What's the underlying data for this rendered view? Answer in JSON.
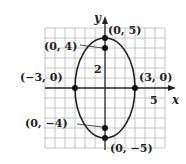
{
  "figure": {
    "axes": {
      "x_label": "x",
      "y_label": "y",
      "x_tick_label": "5",
      "y_tick_label": "2"
    },
    "ellipse": {
      "center": [
        0,
        0
      ],
      "semi_major_vertical": 5,
      "semi_minor_horizontal": 3
    },
    "points": [
      {
        "id": "top-vertex",
        "coords": [
          0,
          5
        ],
        "label": "(0, 5)"
      },
      {
        "id": "top-focus",
        "coords": [
          0,
          4
        ],
        "label": "(0, 4)"
      },
      {
        "id": "left-covertex",
        "coords": [
          -3,
          0
        ],
        "label": "(−3, 0)"
      },
      {
        "id": "right-covertex",
        "coords": [
          3,
          0
        ],
        "label": "(3, 0)"
      },
      {
        "id": "bottom-focus",
        "coords": [
          0,
          -4
        ],
        "label": "(0, −4)"
      },
      {
        "id": "bottom-vertex",
        "coords": [
          0,
          -5
        ],
        "label": "(0, −5)"
      }
    ],
    "colors": {
      "curve": "#222222",
      "grid": "#b8b8b8",
      "background": "#ffffff"
    }
  }
}
